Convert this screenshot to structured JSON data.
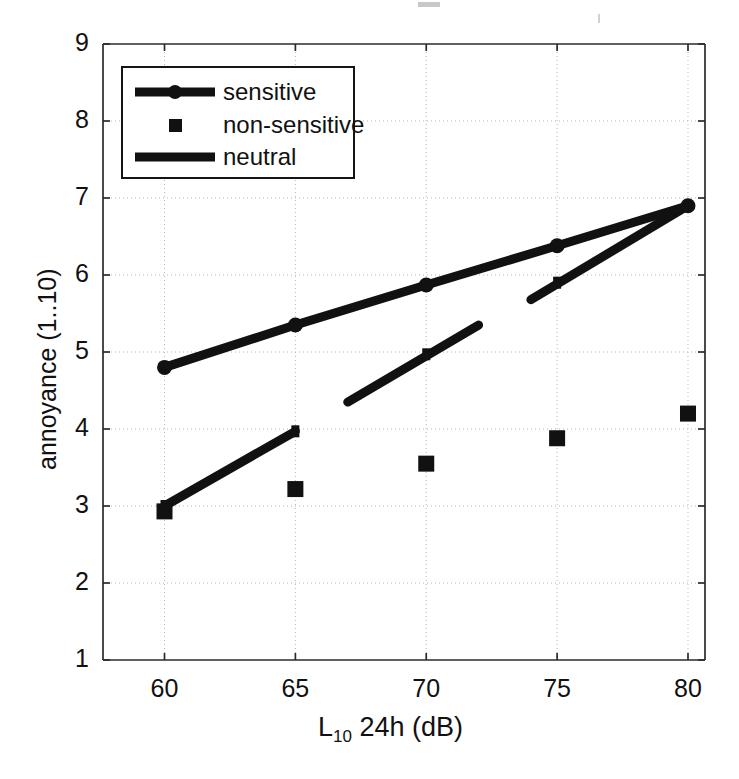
{
  "chart_data": {
    "type": "line",
    "title": "",
    "xlabel": "L10 24h (dB)",
    "xlabel_base": "L",
    "xlabel_sub": "10",
    "xlabel_rest": " 24h (dB)",
    "ylabel": "annoyance (1..10)",
    "xlim": [
      57.65,
      80.65
    ],
    "ylim": [
      1,
      9
    ],
    "xticks": [
      60,
      65,
      70,
      75,
      80
    ],
    "xticklabels": [
      "60",
      "65",
      "70",
      "75",
      "80"
    ],
    "yticks": [
      1,
      2,
      3,
      4,
      5,
      6,
      7,
      8,
      9
    ],
    "yticklabels": [
      "1",
      "2",
      "3",
      "4",
      "5",
      "6",
      "7",
      "8",
      "9"
    ],
    "grid": "dotted-both",
    "legend_position": "upper-left",
    "x": [
      60,
      65,
      70,
      75,
      80
    ],
    "series": [
      {
        "name": "sensitive",
        "marker": "circle",
        "line": true,
        "values": [
          4.8,
          5.35,
          5.87,
          6.38,
          6.9
        ]
      },
      {
        "name": "non-sensitive",
        "marker": "square",
        "line": false,
        "values": [
          2.93,
          3.22,
          3.55,
          3.88,
          4.2
        ]
      },
      {
        "name": "neutral",
        "marker": "none",
        "line": true,
        "broken_line": true,
        "values": [
          3.0,
          3.97,
          4.97,
          5.9,
          6.9
        ],
        "segments": [
          {
            "x0": 60.0,
            "y0": 3.0,
            "x1": 65.0,
            "y1": 3.97
          },
          {
            "x0": 67.0,
            "y0": 4.35,
            "x1": 72.0,
            "y1": 5.35
          },
          {
            "x0": 74.0,
            "y0": 5.68,
            "x1": 80.0,
            "y1": 6.9
          }
        ]
      }
    ]
  },
  "legend": {
    "entries": [
      {
        "label": "sensitive"
      },
      {
        "label": "non-sensitive"
      },
      {
        "label": "neutral"
      }
    ]
  },
  "colors": {
    "line": "#111111",
    "axis": "#2b2b2b",
    "grid": "#b5b5b5",
    "background": "#ffffff"
  }
}
